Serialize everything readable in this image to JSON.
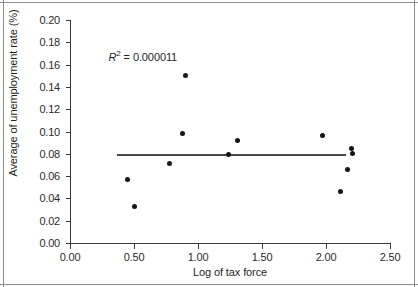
{
  "chart_data": {
    "type": "scatter",
    "title": "",
    "xlabel": "Log of tax force",
    "ylabel": "Average of unemployment rate (%)",
    "xlim": [
      0.0,
      2.5
    ],
    "ylim": [
      0.0,
      0.2
    ],
    "xticks": [
      "0.00",
      "0.50",
      "1.00",
      "1.50",
      "2.00",
      "2.50"
    ],
    "xtick_values": [
      0.0,
      0.5,
      1.0,
      1.5,
      2.0,
      2.5
    ],
    "yticks": [
      "0.00",
      "0.02",
      "0.04",
      "0.06",
      "0.08",
      "0.10",
      "0.12",
      "0.14",
      "0.16",
      "0.18",
      "0.20"
    ],
    "ytick_values": [
      0.0,
      0.02,
      0.04,
      0.06,
      0.08,
      0.1,
      0.12,
      0.14,
      0.16,
      0.18,
      0.2
    ],
    "grid": false,
    "legend": false,
    "points": [
      {
        "x": 0.45,
        "y": 0.057
      },
      {
        "x": 0.5,
        "y": 0.033
      },
      {
        "x": 0.78,
        "y": 0.071
      },
      {
        "x": 0.88,
        "y": 0.098
      },
      {
        "x": 0.9,
        "y": 0.15
      },
      {
        "x": 1.24,
        "y": 0.079
      },
      {
        "x": 1.31,
        "y": 0.092
      },
      {
        "x": 1.97,
        "y": 0.096
      },
      {
        "x": 2.11,
        "y": 0.046
      },
      {
        "x": 2.17,
        "y": 0.066
      },
      {
        "x": 2.2,
        "y": 0.085
      },
      {
        "x": 2.21,
        "y": 0.08
      }
    ],
    "trend_line": {
      "x_start": 0.37,
      "x_end": 2.16,
      "y_start": 0.0797,
      "y_end": 0.0797,
      "slope": 0.0,
      "intercept": 0.0797
    },
    "annotation": {
      "r_symbol": "R",
      "superscript": "2",
      "equals": "=",
      "value": "0.000011",
      "full_text": "R2 = 0.000011",
      "x": 0.3,
      "y": 0.168
    },
    "colors": {
      "marker": "#151515",
      "trend_line": "#4a4a4a",
      "axis": "#3a3a3a",
      "frame": "#8d8d8d",
      "background": "#ffffff",
      "text": "#1f1f1f"
    }
  }
}
